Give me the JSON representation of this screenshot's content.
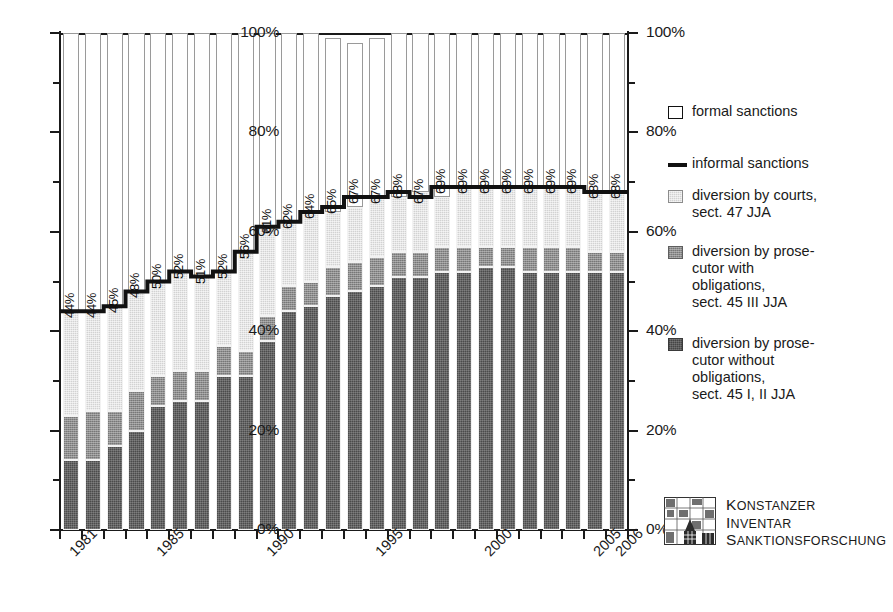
{
  "chart_data": {
    "type": "bar",
    "subtype": "stacked-percentage-bar-with-step-line",
    "title": "",
    "xlabel": "",
    "ylabel": "",
    "ylim": [
      0,
      100
    ],
    "grid": false,
    "legend_position": "right",
    "y_tick_labels_left": [
      "100%",
      "80%",
      "60%",
      "40%",
      "20%",
      "0%"
    ],
    "y_tick_labels_right": [
      "100%",
      "80%",
      "60%",
      "40%",
      "20%",
      "0%"
    ],
    "y_tick_values": [
      100,
      80,
      60,
      40,
      20,
      0
    ],
    "y_minor_tick_values": [
      90,
      70,
      50,
      30,
      10
    ],
    "categories": [
      1981,
      1982,
      1983,
      1984,
      1985,
      1986,
      1987,
      1988,
      1989,
      1990,
      1991,
      1992,
      1993,
      1994,
      1995,
      1996,
      1997,
      1998,
      1999,
      2000,
      2001,
      2002,
      2003,
      2004,
      2005,
      2006
    ],
    "x_tick_labels": [
      {
        "year": 1981,
        "label": "1981"
      },
      {
        "year": 1985,
        "label": "1985"
      },
      {
        "year": 1990,
        "label": "1990"
      },
      {
        "year": 1995,
        "label": "1995"
      },
      {
        "year": 2000,
        "label": "2000"
      },
      {
        "year": 2005,
        "label": "2005"
      },
      {
        "year": 2006,
        "label": "2006"
      }
    ],
    "series": [
      {
        "name": "diversion by prosecutor without obligations, sect. 45 I, II JJA",
        "key": "without_obligations",
        "color": "#656565",
        "values": [
          14,
          14,
          17,
          20,
          25,
          26,
          26,
          31,
          31,
          38,
          44,
          45,
          47,
          48,
          49,
          51,
          51,
          52,
          52,
          53,
          53,
          52,
          52,
          52,
          52,
          52
        ]
      },
      {
        "name": "diversion by prosecutor with obligations, sect. 45 III JJA",
        "key": "with_obligations",
        "color": "#8e8e8e",
        "values": [
          9,
          10,
          7,
          8,
          6,
          6,
          6,
          6,
          5,
          5,
          5,
          5,
          6,
          6,
          6,
          5,
          5,
          5,
          5,
          4,
          4,
          5,
          5,
          5,
          4,
          4
        ]
      },
      {
        "name": "diversion by courts, sect. 47 JJA",
        "key": "by_courts",
        "color": "#d2d2d2",
        "values": [
          21,
          20,
          21,
          20,
          19,
          20,
          19,
          15,
          20,
          18,
          13,
          14,
          11,
          11,
          12,
          11,
          12,
          10,
          12,
          12,
          12,
          12,
          12,
          12,
          12,
          12
        ]
      },
      {
        "name": "formal sanctions",
        "key": "formal",
        "color": "#ffffff",
        "values": [
          56,
          56,
          55,
          52,
          50,
          48,
          49,
          48,
          44,
          39,
          38,
          36,
          35,
          33,
          32,
          33,
          32,
          33,
          31,
          31,
          31,
          31,
          31,
          31,
          32,
          32
        ]
      }
    ],
    "step_line": {
      "name": "informal sanctions",
      "color": "#111111",
      "values": [
        44,
        44,
        45,
        48,
        50,
        52,
        51,
        52,
        56,
        61,
        62,
        64,
        65,
        67,
        67,
        68,
        67,
        69,
        69,
        69,
        69,
        69,
        69,
        69,
        68,
        68
      ],
      "labels": [
        "44%",
        "44%",
        "45%",
        "48%",
        "50%",
        "52%",
        "51%",
        "52%",
        "56%",
        "61%",
        "62%",
        "64%",
        "65%",
        "67%",
        "67%",
        "68%",
        "67%",
        "69%",
        "69%",
        "69%",
        "69%",
        "69%",
        "69%",
        "69%",
        "68%",
        "68%"
      ]
    }
  },
  "legend": {
    "items": [
      {
        "key": "formal",
        "swatch": "formal-sanctions-swatch",
        "lines": [
          "formal sanctions"
        ]
      },
      {
        "key": "line",
        "swatch": "informal-sanctions-swatch",
        "lines": [
          "informal sanctions"
        ]
      },
      {
        "key": "courts",
        "swatch": "diversion-by-courts-swatch",
        "lines": [
          "diversion by courts,",
          "sect. 47 JJA"
        ]
      },
      {
        "key": "with",
        "swatch": "diversion-with-obligations-swatch",
        "lines": [
          "diversion by prose-",
          "cutor with",
          "obligations,",
          "sect. 45 III JJA"
        ]
      },
      {
        "key": "without",
        "swatch": "diversion-without-obligations-swatch",
        "lines": [
          "diversion by prose-",
          "cutor without",
          "obligations,",
          "sect. 45 I, II JJA"
        ]
      }
    ]
  },
  "footer": {
    "logo_lines": [
      {
        "cap": "K",
        "rest": "onstanzer"
      },
      {
        "cap": "I",
        "rest": "nventar"
      },
      {
        "cap": "S",
        "rest": "anktionsforschung"
      }
    ]
  }
}
